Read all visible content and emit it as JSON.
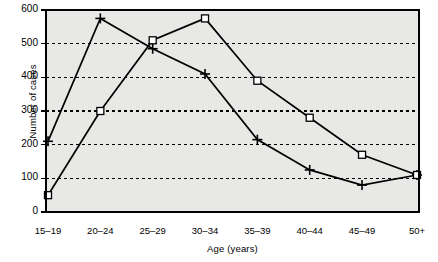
{
  "chart_data": {
    "type": "line",
    "title": "",
    "subtitle": "",
    "xlabel": "Age (years)",
    "ylabel": "Number of cases",
    "categories": [
      "15–19",
      "20–24",
      "25–29",
      "30–34",
      "35–39",
      "40–44",
      "45–49",
      "50+"
    ],
    "ylim": [
      0,
      600
    ],
    "yticks": [
      0,
      100,
      200,
      300,
      400,
      500,
      600
    ],
    "ytick_labels": [
      "0",
      "100",
      "200",
      "300",
      "400",
      "500",
      "600"
    ],
    "grid": "horizontal-dashed",
    "legend": "none",
    "series": [
      {
        "name": "series-square",
        "marker": "open-square",
        "values": [
          50,
          300,
          510,
          575,
          390,
          280,
          170,
          110
        ]
      },
      {
        "name": "series-plus",
        "marker": "plus",
        "values": [
          210,
          575,
          485,
          410,
          215,
          125,
          80,
          110
        ]
      }
    ],
    "colors": {
      "plot_background": "#e8e8e6",
      "axis": "#000000",
      "grid": "#000000",
      "series_square": "#000000",
      "series_plus": "#000000",
      "page_background": "#ffffff"
    }
  }
}
